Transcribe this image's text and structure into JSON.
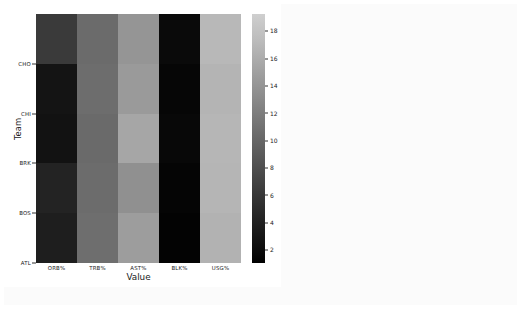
{
  "chart_data": {
    "type": "heatmap",
    "title": "",
    "xlabel": "Value",
    "ylabel": "Team",
    "categories": [
      "ORB%",
      "TRB%",
      "AST%",
      "BLK%",
      "USG%"
    ],
    "rows": [
      "CHO",
      "CHI",
      "BRK",
      "BOS",
      "ATL"
    ],
    "row_order_note": "rows listed top-to-bottom as drawn on the y-axis",
    "grid": false,
    "legend_position": "right-colorbar",
    "colormap": "grayscale",
    "colorbar": {
      "ticks": [
        18,
        16,
        14,
        12,
        10,
        8,
        6,
        4,
        2
      ],
      "vmin": 1.0,
      "vmax": 19.2,
      "low_color": "#000000",
      "high_color": "#cfcfcf"
    },
    "cells": [
      {
        "row": "CHO",
        "values": [
          7.0,
          12.0,
          15.3,
          1.2,
          18.4
        ]
      },
      {
        "row": "CHI",
        "values": [
          2.2,
          11.2,
          15.9,
          1.0,
          17.9
        ]
      },
      {
        "row": "BRK",
        "values": [
          2.0,
          11.0,
          17.1,
          1.1,
          18.2
        ]
      },
      {
        "row": "BOS",
        "values": [
          3.4,
          11.4,
          14.5,
          1.0,
          18.0
        ]
      },
      {
        "row": "ATL",
        "values": [
          3.0,
          11.6,
          16.2,
          0.9,
          17.6
        ]
      }
    ],
    "cell_colors": [
      [
        "#3a3a3a",
        "#6b6b6b",
        "#959595",
        "#0a0a0a",
        "#b8b8b8"
      ],
      [
        "#141414",
        "#6d6d6d",
        "#9a9a9a",
        "#060606",
        "#b4b4b4"
      ],
      [
        "#121212",
        "#6a6a6a",
        "#a6a6a6",
        "#080808",
        "#b6b6b6"
      ],
      [
        "#232323",
        "#6c6c6c",
        "#909090",
        "#050505",
        "#b5b5b5"
      ],
      [
        "#1e1e1e",
        "#6e6e6e",
        "#9d9d9d",
        "#030303",
        "#b2b2b2"
      ]
    ]
  },
  "figure": {
    "background": "#ffffff",
    "page_background": "#fbfbfb"
  }
}
